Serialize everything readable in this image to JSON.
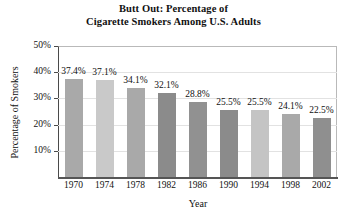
{
  "chart_data": {
    "type": "bar",
    "title": "Butt Out: Percentage of Cigarette Smokers Among U.S. Adults",
    "title_line1": "Butt Out: Percentage of",
    "title_line2": "Cigarette Smokers Among U.S. Adults",
    "xlabel": "Year",
    "ylabel": "Percentage of Smokers",
    "categories": [
      "1970",
      "1974",
      "1978",
      "1982",
      "1986",
      "1990",
      "1994",
      "1998",
      "2002"
    ],
    "values": [
      37.4,
      37.1,
      34.1,
      32.1,
      28.8,
      25.5,
      25.5,
      24.1,
      22.5
    ],
    "value_labels": [
      "37.4%",
      "37.1%",
      "34.1%",
      "32.1%",
      "28.8%",
      "25.5%",
      "25.5%",
      "24.1%",
      "22.5%"
    ],
    "ylim": [
      0,
      50
    ],
    "ytick_values": [
      10,
      20,
      30,
      40,
      50
    ],
    "ytick_labels": [
      "10%",
      "20%",
      "30%",
      "40%",
      "50%"
    ],
    "grid": true,
    "legend": "none",
    "bar_colors": [
      "#a9a9a9",
      "#c9c9c9",
      "#a9a9a9",
      "#8b8b8b",
      "#919191",
      "#8b8b8b",
      "#c4c4c4",
      "#a9a9a9",
      "#8f8f8f"
    ]
  }
}
